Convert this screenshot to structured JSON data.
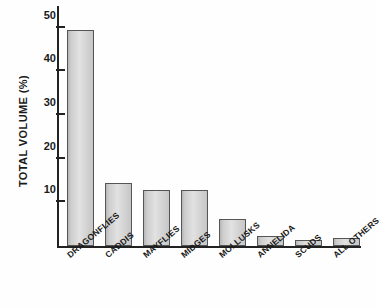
{
  "chart_data": {
    "type": "bar",
    "title": "",
    "subtitle": "",
    "xlabel": "",
    "ylabel": "TOTAL VOLUME  (%)",
    "categories": [
      "DRAGONFLIES",
      "CADDIS",
      "MAYFLIES",
      "MIDGES",
      "MOLLUSKS",
      "ANNELIDA",
      "SCUDS",
      "ALL OTHERS"
    ],
    "values": [
      49.5,
      14.5,
      12.8,
      12.8,
      6.2,
      2.2,
      1.3,
      1.9
    ],
    "ylim": [
      0,
      55
    ],
    "yticks": [
      10,
      20,
      30,
      40,
      50
    ],
    "ytick_labels": [
      "10",
      "20",
      "30",
      "40",
      "50"
    ],
    "grid": false,
    "legend": false,
    "bar_fill_color": "#d2d2d2",
    "bar_edge_color": "#555555",
    "axis_color": "#222222",
    "background_color": "#ffffff"
  }
}
